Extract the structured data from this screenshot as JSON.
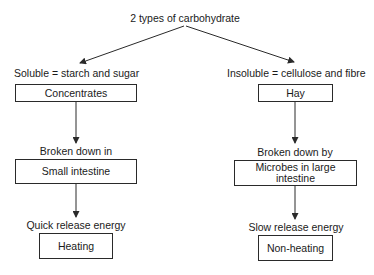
{
  "diagram": {
    "root": "2 types of carbohydrate",
    "left": {
      "category": "Soluble = starch and sugar",
      "source": "Concentrates",
      "digestion_label": "Broken down in",
      "digestion_site": "Small intestine",
      "energy_label": "Quick release energy",
      "effect": "Heating"
    },
    "right": {
      "category": "Insoluble = cellulose and fibre",
      "source": "Hay",
      "digestion_label": "Broken down by",
      "digestion_site": "Microbes in large intestine",
      "energy_label": "Slow release energy",
      "effect": "Non-heating"
    }
  },
  "colors": {
    "line": "#2a2a2a",
    "text": "#1a1a1a",
    "background": "#ffffff"
  }
}
